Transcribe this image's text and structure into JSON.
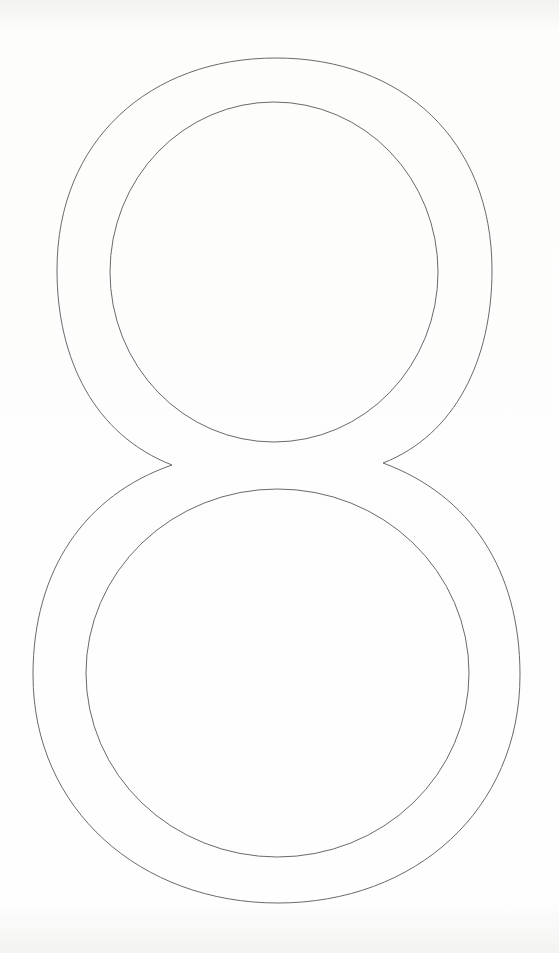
{
  "page": {
    "digit": "8",
    "stroke_color": "#6a6a6a",
    "background_color": "#fdfdfc"
  }
}
